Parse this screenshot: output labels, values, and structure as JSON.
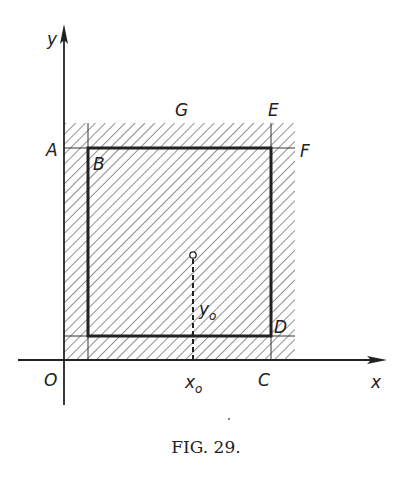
{
  "figure": {
    "caption": "Fig. 29.",
    "caption_display": "FIG. 29."
  },
  "axes": {
    "x_label": "x",
    "y_label": "y",
    "origin_label": "O"
  },
  "points": {
    "A": "A",
    "B": "B",
    "C": "C",
    "D": "D",
    "E": "E",
    "F": "F",
    "G": "G"
  },
  "marker": {
    "x_label": "x",
    "x_sub": "o",
    "y_label": "y",
    "y_sub": "o"
  },
  "colors": {
    "ink": "#222222",
    "background": "#ffffff"
  }
}
